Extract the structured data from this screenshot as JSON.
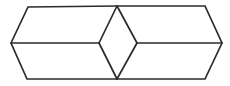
{
  "figure": {
    "type": "line-drawing",
    "canvas": {
      "width": 230,
      "height": 86,
      "background": "#ffffff"
    },
    "stroke": {
      "color": "#2b2b2b",
      "width": 1.7
    },
    "fill": "#ffffff",
    "vertices": {
      "left_point": {
        "name": "left-point",
        "x": 11,
        "y": 43
      },
      "top_left": {
        "name": "top-left",
        "x": 28,
        "y": 7
      },
      "top_center": {
        "name": "top-center",
        "x": 117,
        "y": 6
      },
      "top_right": {
        "name": "top-right",
        "x": 205,
        "y": 6
      },
      "right_point": {
        "name": "right-point",
        "x": 222,
        "y": 43
      },
      "bottom_right": {
        "name": "bottom-right",
        "x": 205,
        "y": 79
      },
      "bottom_center": {
        "name": "bottom-center",
        "x": 117,
        "y": 79
      },
      "bottom_left": {
        "name": "bottom-left",
        "x": 27,
        "y": 79
      },
      "rhombus_left": {
        "name": "rhombus-left",
        "x": 99,
        "y": 43
      },
      "rhombus_right": {
        "name": "rhombus-right",
        "x": 137,
        "y": 43
      }
    },
    "outline_path": "M 11 43 L 28 7 L 117 6 L 205 6 L 222 43 L 205 79 L 117 79 L 27 79 Z",
    "edges": [
      {
        "name": "edge-outline",
        "d": "M 11 43 L 28 7 L 117 6 L 205 6 L 222 43 L 205 79 L 117 79 L 27 79 Z"
      },
      {
        "name": "edge-middle-left",
        "d": "M 11 43 L 99 43"
      },
      {
        "name": "edge-middle-right",
        "d": "M 137 43 L 222 43"
      },
      {
        "name": "edge-rhombus-upper-left",
        "d": "M 99 43 L 117 6"
      },
      {
        "name": "edge-rhombus-upper-right",
        "d": "M 117 6 L 137 43"
      },
      {
        "name": "edge-rhombus-lower-right",
        "d": "M 137 43 L 117 79"
      },
      {
        "name": "edge-rhombus-lower-left",
        "d": "M 117 79 L 99 43"
      }
    ],
    "faces": [
      {
        "name": "face-left-upper",
        "d": "M 11 43 L 28 7 L 117 6 L 99 43 Z"
      },
      {
        "name": "face-left-lower",
        "d": "M 11 43 L 99 43 L 117 79 L 27 79 Z"
      },
      {
        "name": "face-right-upper",
        "d": "M 137 43 L 117 6 L 205 6 L 222 43 Z"
      },
      {
        "name": "face-right-lower",
        "d": "M 137 43 L 222 43 L 205 79 L 117 79 Z"
      },
      {
        "name": "face-center-rhombus",
        "d": "M 99 43 L 117 6 L 137 43 L 117 79 Z"
      }
    ]
  }
}
